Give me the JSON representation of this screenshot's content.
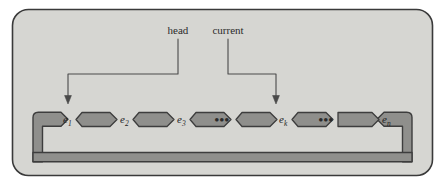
{
  "figure": {
    "panel": {
      "fill": "#d6d6d2",
      "border": "#3a3a3a",
      "outside": "#ffffff"
    },
    "pointer_labels": [
      {
        "name": "head",
        "text": "head",
        "target": "e1"
      },
      {
        "name": "current",
        "text": "current",
        "target": "ek"
      }
    ],
    "nodes": [
      {
        "id": "e1",
        "base": "e",
        "sub": "1"
      },
      {
        "id": "e2",
        "base": "e",
        "sub": "2"
      },
      {
        "id": "e3",
        "base": "e",
        "sub": "3"
      },
      {
        "id": "ek",
        "base": "e",
        "sub": "k"
      },
      {
        "id": "en",
        "base": "e",
        "sub": "n"
      }
    ],
    "ellipses": [
      {
        "id": "ellipsis-1",
        "text": "•••"
      },
      {
        "id": "ellipsis-2",
        "text": "•••"
      }
    ],
    "link_colors": {
      "fill": "#8f8f8c",
      "stroke": "#3d3d3d"
    },
    "arrow_color": "#4a4a4a"
  }
}
